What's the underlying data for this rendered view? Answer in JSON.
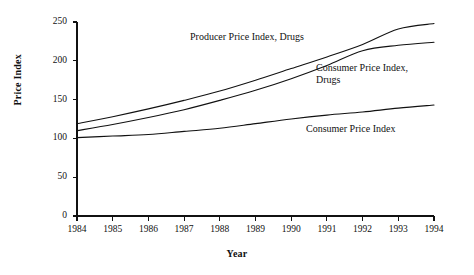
{
  "chart_data": {
    "type": "line",
    "title": "",
    "subtitle": "",
    "xlabel": "Year",
    "ylabel": "Price Index",
    "xlim": [
      1984,
      1994
    ],
    "ylim": [
      0,
      250
    ],
    "grid": false,
    "legend_position": "inline-annotations",
    "x": [
      1984,
      1985,
      1986,
      1987,
      1988,
      1989,
      1990,
      1991,
      1992,
      1993,
      1994
    ],
    "xticklabels": [
      "1984",
      "1985",
      "1986",
      "1987",
      "1988",
      "1989",
      "1990",
      "1991",
      "1992",
      "1993",
      "1994"
    ],
    "yticks": [
      0,
      50,
      100,
      150,
      200,
      250
    ],
    "yticklabels": [
      "0",
      "50",
      "100",
      "150",
      "200",
      "250"
    ],
    "series": [
      {
        "name": "Producer Price Index, Drugs",
        "values": [
          119,
          128,
          138,
          149,
          161,
          175,
          190,
          205,
          221,
          241,
          248
        ]
      },
      {
        "name": "Consumer Price Index, Drugs",
        "values": [
          110,
          118,
          127,
          137,
          149,
          162,
          177,
          194,
          213,
          220,
          224
        ]
      },
      {
        "name": "Consumer Price Index",
        "values": [
          101,
          103,
          105,
          109,
          113,
          119,
          125,
          130,
          134,
          139,
          143
        ]
      }
    ],
    "annotations": [
      {
        "text": "Producer Price Index, Drugs",
        "x": 190,
        "y": 31
      },
      {
        "text": "Consumer Price Index,\nDrugs",
        "x": 316,
        "y": 62
      },
      {
        "text": "Consumer Price Index",
        "x": 306,
        "y": 123
      }
    ],
    "colors": {
      "line": "#111111",
      "axis": "#111111",
      "background": "#ffffff",
      "text": "#111111"
    }
  }
}
